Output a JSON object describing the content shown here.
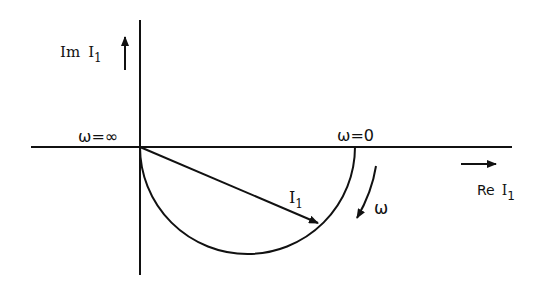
{
  "diagram": {
    "type": "phasor-locus",
    "axes": {
      "imag_label_prefix": "Im",
      "imag_label_var": "I",
      "imag_label_sub": "1",
      "real_label_prefix": "Re",
      "real_label_var": "I",
      "real_label_sub": "1"
    },
    "annotations": {
      "omega_infinity": "ω=∞",
      "omega_zero": "ω=0",
      "phasor_var": "I",
      "phasor_sub": "1",
      "omega_direction": "ω"
    },
    "colors": {
      "ink": "#111111",
      "background": "#ffffff"
    }
  }
}
